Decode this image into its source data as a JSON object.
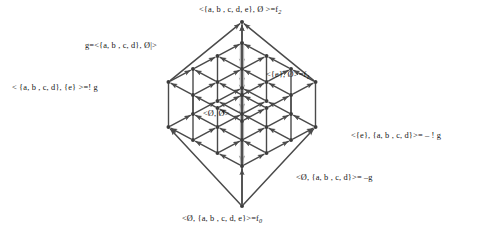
{
  "diagram": {
    "type": "hasse-lattice-3d",
    "colors": {
      "edge": "#4a4a4a",
      "node": "#3c3c3c",
      "highlight": "#b5b5b5",
      "background": "#ffffff",
      "text": "#141414"
    },
    "geometry": {
      "grid_n": 4,
      "dx": 24.5,
      "dy": 13.0,
      "layer_gap": 45,
      "origin_x": 242,
      "origin_top_y": 82,
      "apex_top": {
        "x": 242,
        "y": 22
      },
      "apex_bottom": {
        "x": 242,
        "y": 206
      }
    }
  },
  "labels": [
    {
      "id": "top-apex-label",
      "name": "label-top-apex",
      "text": "<{a, b , c, d, e}, Ø >=f",
      "sub": "2",
      "x": 199,
      "y": 6,
      "align": "left"
    },
    {
      "id": "g-label",
      "name": "label-g-node",
      "text": "g=<{a, b , c, d}, Ø|>",
      "sub": "",
      "x": 85,
      "y": 42,
      "align": "left"
    },
    {
      "id": "f1-label",
      "name": "label-f1-node",
      "text": "<{e}, Ø>=f",
      "sub": "1",
      "x": 266,
      "y": 71,
      "align": "left"
    },
    {
      "id": "not-g-label",
      "name": "label-bang-g-node",
      "text": "< {a, b , c, d}, {e} >=! g",
      "sub": "",
      "x": 12,
      "y": 84,
      "align": "left"
    },
    {
      "id": "center-label",
      "name": "label-center-node",
      "text": "<Ø, Ø>",
      "sub": "",
      "x": 203,
      "y": 110,
      "align": "left"
    },
    {
      "id": "neg-bang-g-label",
      "name": "label-neg-bang-g-node",
      "text": "<{e}, {a, b , c, d}>= – ! g",
      "sub": "",
      "x": 351,
      "y": 132,
      "align": "left"
    },
    {
      "id": "neg-g-label",
      "name": "label-neg-g-node",
      "text": "<Ø, {a, b , c, d}>= –g",
      "sub": "",
      "x": 296,
      "y": 174,
      "align": "left"
    },
    {
      "id": "bottom-apex-label",
      "name": "label-bottom-apex",
      "text": "<Ø, {a, b , c, d, e}>=f",
      "sub": "0",
      "x": 182,
      "y": 215,
      "align": "left"
    }
  ],
  "nodes": [
    {
      "name": "apex-top",
      "label_ref": "top-apex-label",
      "x": 242,
      "y": 22
    },
    {
      "name": "node-g",
      "label_ref": "g-label",
      "x": 168,
      "y": 82
    },
    {
      "name": "node-f1",
      "label_ref": "f1-label",
      "x": 315,
      "y": 82
    },
    {
      "name": "node-bang-g",
      "label_ref": "not-g-label",
      "x": 131,
      "y": 95
    },
    {
      "name": "node-center",
      "label_ref": "center-label",
      "x": 242,
      "y": 134
    },
    {
      "name": "node-neg-bang-g",
      "label_ref": "neg-bang-g-label",
      "x": 352,
      "y": 134
    },
    {
      "name": "node-neg-g",
      "label_ref": "neg-g-label",
      "x": 294,
      "y": 173
    },
    {
      "name": "apex-bottom",
      "label_ref": "bottom-apex-label",
      "x": 242,
      "y": 206
    }
  ],
  "highlight_path": {
    "name": "highlighted-negation-path",
    "description": "gray thick path from g through the lattice down to –g",
    "color": "#b5b5b5"
  }
}
